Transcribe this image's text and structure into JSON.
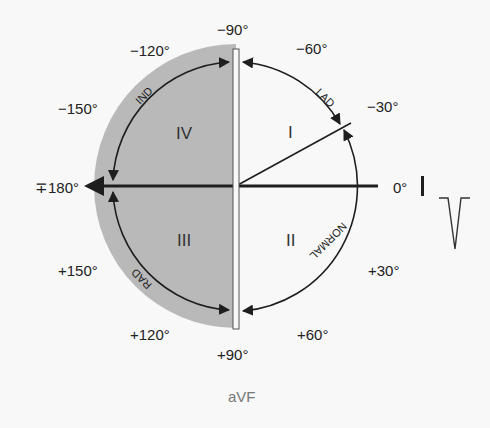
{
  "diagram": {
    "type": "hexaxial-reference-quadrant",
    "center": {
      "x": 236,
      "y": 186
    },
    "angle_labels": [
      {
        "id": "m90",
        "text": "−90°"
      },
      {
        "id": "m60",
        "text": "−60°"
      },
      {
        "id": "m30",
        "text": "−30°"
      },
      {
        "id": "zero",
        "text": "0°"
      },
      {
        "id": "p30",
        "text": "+30°"
      },
      {
        "id": "p60",
        "text": "+60°"
      },
      {
        "id": "p90",
        "text": "+90°"
      },
      {
        "id": "p120",
        "text": "+120°"
      },
      {
        "id": "p150",
        "text": "+150°"
      },
      {
        "id": "pm180",
        "text": "∓180°"
      },
      {
        "id": "m150",
        "text": "−150°"
      },
      {
        "id": "m120",
        "text": "−120°"
      }
    ],
    "quadrants": [
      {
        "id": "I",
        "text": "I"
      },
      {
        "id": "II",
        "text": "II"
      },
      {
        "id": "III",
        "text": "III"
      },
      {
        "id": "IV",
        "text": "IV"
      }
    ],
    "arc_labels": {
      "lad": "LAD",
      "normal": "NORMAL",
      "rad": "RAD",
      "ind": "IND"
    },
    "leads": {
      "lead_I": "I",
      "lead_aVF": "aVF"
    },
    "colors": {
      "shade": "#b9b9b9",
      "line": "#1e1e1e",
      "background": "#f8f8f8"
    }
  }
}
